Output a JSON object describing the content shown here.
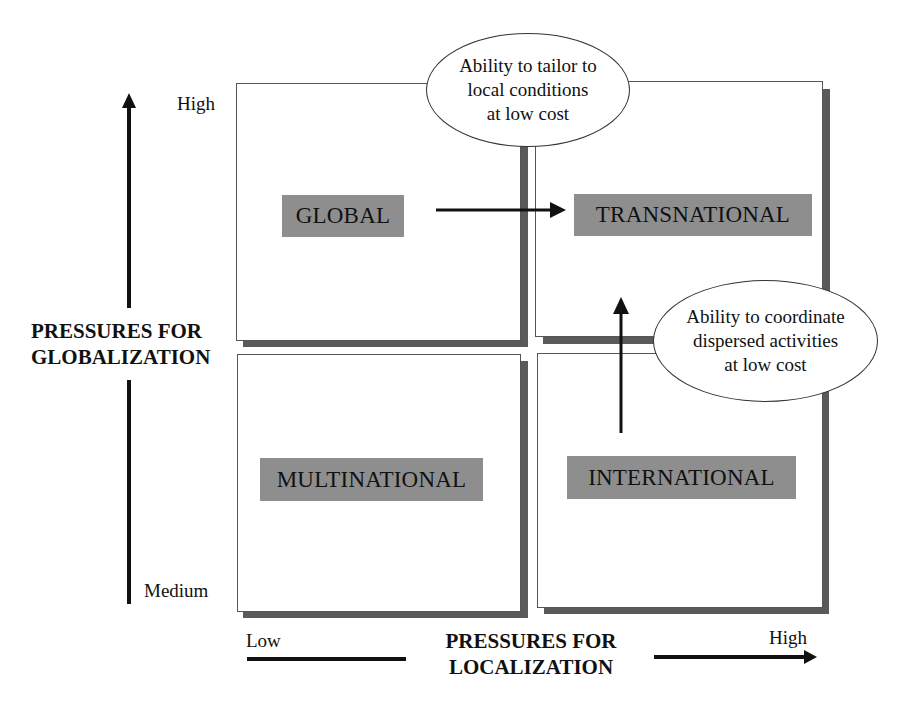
{
  "diagram": {
    "type": "2x2 strategy matrix",
    "y_axis": {
      "title_line1": "PRESSURES FOR",
      "title_line2": "GLOBALIZATION",
      "high_label": "High",
      "low_label": "Medium"
    },
    "x_axis": {
      "title_line1": "PRESSURES FOR",
      "title_line2": "LOCALIZATION",
      "low_label": "Low",
      "high_label": "High"
    },
    "quadrants": {
      "top_left": "GLOBAL",
      "top_right": "TRANSNATIONAL",
      "bottom_left": "MULTINATIONAL",
      "bottom_right": "INTERNATIONAL"
    },
    "callouts": {
      "top": {
        "line1": "Ability to tailor to",
        "line2": "local conditions",
        "line3": "at low cost"
      },
      "right": {
        "line1": "Ability to coordinate",
        "line2": "dispersed activities",
        "line3": "at low cost"
      }
    },
    "arrows": [
      {
        "from": "GLOBAL",
        "to": "TRANSNATIONAL"
      },
      {
        "from": "INTERNATIONAL",
        "to": "TRANSNATIONAL"
      }
    ],
    "colors": {
      "label_fill": "#8e8e8e",
      "shadow": "#5a5a5a",
      "border": "#555555"
    }
  }
}
